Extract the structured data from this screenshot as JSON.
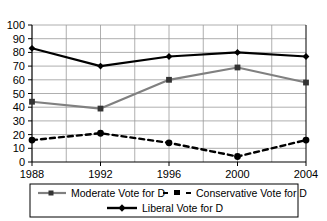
{
  "chart_data": {
    "type": "line",
    "title": "",
    "xlabel": "",
    "ylabel": "",
    "x": [
      1988,
      1992,
      1996,
      2000,
      2004
    ],
    "xtick_labels": [
      "1988",
      "1992",
      "1996",
      "2000",
      "2004"
    ],
    "ytick_labels": [
      "0",
      "10",
      "20",
      "30",
      "40",
      "50",
      "60",
      "70",
      "80",
      "90",
      "100"
    ],
    "yticks": [
      0,
      10,
      20,
      30,
      40,
      50,
      60,
      70,
      80,
      90,
      100
    ],
    "ylim": [
      0,
      100
    ],
    "xlim": [
      1988,
      2004
    ],
    "grid": true,
    "grid_minor_x": [
      1990,
      1994,
      1998,
      2002
    ],
    "legend_position": "bottom",
    "series": [
      {
        "name": "Moderate Vote for D",
        "values": [
          44,
          39,
          60,
          69,
          58
        ],
        "color": "#808080",
        "style": "solid",
        "marker": "square"
      },
      {
        "name": "Conservative Vote for D",
        "values": [
          16,
          21,
          14,
          4,
          16
        ],
        "color": "#000000",
        "style": "dashed",
        "marker": "square"
      },
      {
        "name": "Liberal Vote for D",
        "values": [
          83,
          70,
          77,
          80,
          77
        ],
        "color": "#000000",
        "style": "solid",
        "marker": "diamond"
      }
    ]
  },
  "legend": {
    "entries": [
      {
        "label": "Moderate Vote for D"
      },
      {
        "label": "Conservative Vote for D"
      },
      {
        "label": "Liberal Vote for D"
      }
    ]
  },
  "colors": {
    "moderate": "#808080",
    "conservative": "#000000",
    "liberal": "#000000",
    "grid": "#9a9a9a",
    "axis": "#000000",
    "background": "#ffffff"
  }
}
